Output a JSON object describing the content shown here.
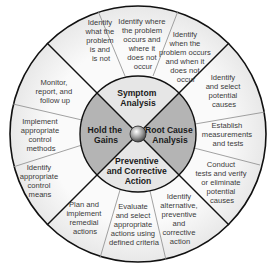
{
  "diagram": {
    "type": "problem-solving-wheel",
    "colors": {
      "outer_ring_fill": "#f4f4f4",
      "quadrant_light": "#e6e6e6",
      "quadrant_dark": "#b4b4b4",
      "line": "#111111",
      "divider": "#8a8a8a"
    },
    "quadrants": [
      {
        "id": "top",
        "lines": [
          "Symptom",
          "Analysis"
        ]
      },
      {
        "id": "right",
        "lines": [
          "Root Cause",
          "Analysis"
        ]
      },
      {
        "id": "bottom",
        "lines": [
          "Preventive",
          "and Corrective",
          "Action"
        ]
      },
      {
        "id": "left",
        "lines": [
          "Hold the",
          "Gains"
        ]
      }
    ],
    "segments": [
      {
        "lines": [
          "Identify",
          "what the",
          "problem",
          "is and",
          "is not"
        ]
      },
      {
        "lines": [
          "Identify where",
          "the problem",
          "occurs and",
          "where it",
          "does not",
          "occur"
        ]
      },
      {
        "lines": [
          "Identify",
          "when the",
          "problem occurs",
          "and when it",
          "does not",
          "occur"
        ]
      },
      {
        "lines": [
          "Identify",
          "and select",
          "potential",
          "causes"
        ]
      },
      {
        "lines": [
          "Establish",
          "measurements",
          "and tests"
        ]
      },
      {
        "lines": [
          "Conduct",
          "tests and verify",
          "or eliminate",
          "potential",
          "causes"
        ]
      },
      {
        "lines": [
          "Identify",
          "alternative,",
          "preventive",
          "and",
          "corrective",
          "action"
        ]
      },
      {
        "lines": [
          "Evaluate",
          "and select",
          "appropriate",
          "actions using",
          "defined criteria"
        ]
      },
      {
        "lines": [
          "Plan and",
          "implement",
          "remedial",
          "actions"
        ]
      },
      {
        "lines": [
          "Identify",
          "appropriate",
          "control",
          "means"
        ]
      },
      {
        "lines": [
          "Implement",
          "appropriate",
          "control",
          "methods"
        ]
      },
      {
        "lines": [
          "Monitor,",
          "report, and",
          "follow up"
        ]
      }
    ]
  }
}
